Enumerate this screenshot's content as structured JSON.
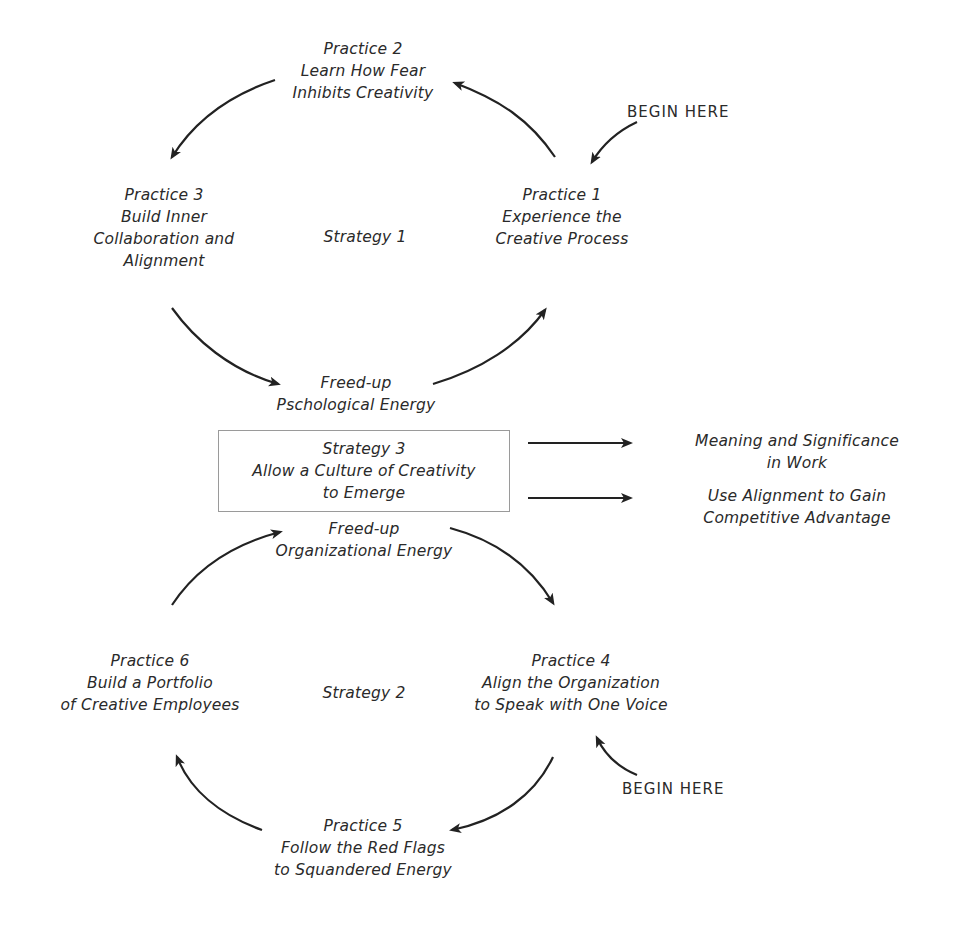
{
  "diagram": {
    "strategy1": {
      "label": "Strategy 1",
      "practices": [
        {
          "id": "practice-1",
          "title": "Practice 1",
          "lines": [
            "Experience the",
            "Creative Process"
          ]
        },
        {
          "id": "practice-2",
          "title": "Practice 2",
          "lines": [
            "Learn How Fear",
            "Inhibits Creativity"
          ]
        },
        {
          "id": "practice-3",
          "title": "Practice 3",
          "lines": [
            "Build Inner",
            "Collaboration and",
            "Alignment"
          ]
        }
      ],
      "energy": [
        "Freed-up",
        "Pschological Energy"
      ],
      "begin_here": "BEGIN HERE"
    },
    "strategy3": {
      "lines": [
        "Strategy 3",
        "Allow a Culture of Creativity",
        "to Emerge"
      ]
    },
    "outcomes": [
      {
        "lines": [
          "Meaning and Significance",
          "in Work"
        ]
      },
      {
        "lines": [
          "Use Alignment to Gain",
          "Competitive Advantage"
        ]
      }
    ],
    "strategy2": {
      "label": "Strategy 2",
      "practices": [
        {
          "id": "practice-4",
          "title": "Practice 4",
          "lines": [
            "Align the Organization",
            "to Speak with One Voice"
          ]
        },
        {
          "id": "practice-5",
          "title": "Practice 5",
          "lines": [
            "Follow the Red Flags",
            "to Squandered Energy"
          ]
        },
        {
          "id": "practice-6",
          "title": "Practice 6",
          "lines": [
            "Build a Portfolio",
            "of Creative Employees"
          ]
        }
      ],
      "energy": [
        "Freed-up",
        "Organizational Energy"
      ],
      "begin_here": "BEGIN HERE"
    },
    "colors": {
      "text": "#2a2a2a",
      "arrow": "#222222",
      "box_border": "#9a9a9a",
      "background": "#ffffff"
    }
  }
}
